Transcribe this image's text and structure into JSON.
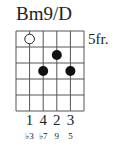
{
  "chord": {
    "name": "Bm9/D",
    "fret_label": "5fr.",
    "strings": 6,
    "frets": 5,
    "dots": [
      {
        "string": 2,
        "fret": 1,
        "type": "open-circle"
      },
      {
        "string": 4,
        "fret": 2,
        "type": "filled"
      },
      {
        "string": 3,
        "fret": 3,
        "type": "filled"
      },
      {
        "string": 5,
        "fret": 3,
        "type": "filled"
      }
    ],
    "fingers": [
      "1",
      "4",
      "2",
      "3"
    ],
    "degrees": [
      "♭3",
      "♭7",
      "9",
      "5"
    ]
  }
}
